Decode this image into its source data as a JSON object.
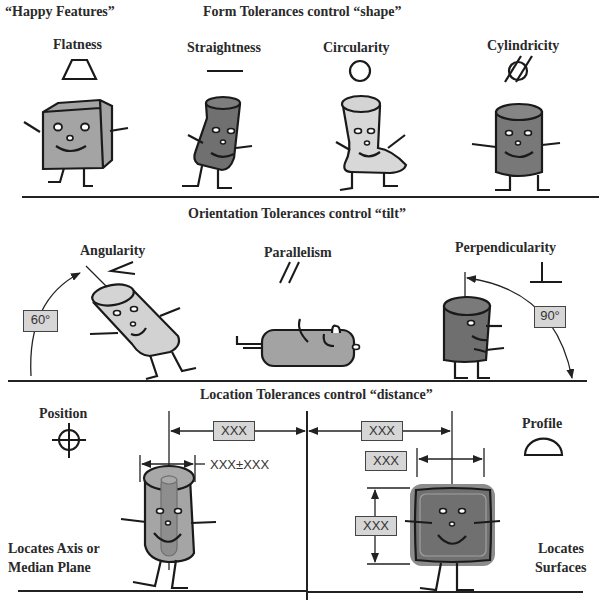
{
  "form": {
    "label": "“Happy Features”",
    "title": "Form Tolerances control “shape”",
    "items": [
      {
        "name": "Flatness",
        "symbol": "parallelogram"
      },
      {
        "name": "Straightness",
        "symbol": "line"
      },
      {
        "name": "Circularity",
        "symbol": "circle"
      },
      {
        "name": "Cylindricity",
        "symbol": "circle-with-tangent-lines"
      }
    ]
  },
  "orientation": {
    "title": "Orientation Tolerances control “tilt”",
    "items": [
      {
        "name": "Angularity",
        "symbol": "angle",
        "angle_label": "60°"
      },
      {
        "name": "Parallelism",
        "symbol": "double-slash"
      },
      {
        "name": "Perpendicularity",
        "symbol": "perpendicular",
        "angle_label": "90°"
      }
    ]
  },
  "location": {
    "title": "Location Tolerances control “distance”",
    "position": {
      "name": "Position",
      "symbol": "crosshair-circle",
      "caption_line1": "Locates Axis or",
      "caption_line2": "Median Plane",
      "dim_basic": "XXX",
      "dim_size": "XXX±XXX"
    },
    "profile": {
      "name": "Profile",
      "symbol": "semicircle",
      "caption_line1": "Locates",
      "caption_line2": "Surfaces",
      "dim_top": "XXX",
      "dim_width": "XXX",
      "dim_height": "XXX"
    }
  },
  "colors": {
    "light_fill": "#d4d4d4",
    "mid_fill": "#a8a8a8",
    "dark_fill": "#8a8a8a",
    "stroke": "#1a1a1a",
    "box_fill": "#d6d6d6"
  }
}
